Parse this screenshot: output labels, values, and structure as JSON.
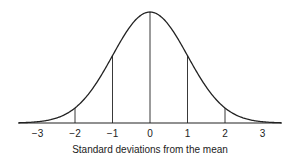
{
  "chart_data": {
    "type": "line",
    "title": "",
    "xlabel": "Standard deviations from the mean",
    "ylabel": "",
    "x_ticks": [
      -3,
      -2,
      -1,
      0,
      1,
      2,
      3
    ],
    "x_tick_labels": [
      "−3",
      "−2",
      "−1",
      "0",
      "1",
      "2",
      "3"
    ],
    "xlim": [
      -3.5,
      3.5
    ],
    "ylim": [
      0,
      1
    ],
    "grid": false,
    "legend": null,
    "series": [
      {
        "name": "Normal distribution",
        "x": [
          -3.5,
          -3,
          -2.5,
          -2,
          -1.5,
          -1,
          -0.5,
          0,
          0.5,
          1,
          1.5,
          2,
          2.5,
          3,
          3.5
        ],
        "values": [
          0.002,
          0.011,
          0.044,
          0.135,
          0.325,
          0.607,
          0.882,
          1.0,
          0.882,
          0.607,
          0.325,
          0.135,
          0.044,
          0.011,
          0.002
        ]
      }
    ],
    "reference_lines": [
      {
        "x": -2,
        "height": 0.135
      },
      {
        "x": -1,
        "height": 0.607
      },
      {
        "x": 0,
        "height": 1.0
      },
      {
        "x": 1,
        "height": 0.607
      },
      {
        "x": 2,
        "height": 0.135
      }
    ],
    "colors": {
      "line": "#222222",
      "background": "#ffffff"
    }
  }
}
